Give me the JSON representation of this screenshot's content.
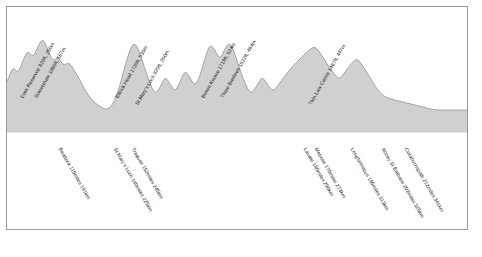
{
  "chart_data": {
    "type": "area",
    "title": "",
    "subtitle": "",
    "xlabel": "",
    "ylabel": "",
    "grid": false,
    "legend_position": "none",
    "axis": {
      "x_range_km": [
        191,
        341
      ],
      "y_range_m": [
        0,
        600
      ]
    },
    "summit_labels": [
      {
        "name": "Daer Reservoir",
        "elev_ft": "820ft",
        "elev_m": "250m",
        "text": "Daer Reservoir 820ft, 250m",
        "x": 24,
        "y": 94
      },
      {
        "name": "Sweetshaw",
        "elev_ft": "1860ft",
        "elev_m": "567m",
        "text": "Sweetshaw 1860ft, 567m",
        "x": 38,
        "y": 94
      },
      {
        "name": "Ettrick Head",
        "elev_ft": "1739ft",
        "elev_m": "530m",
        "text": "Ettrick Head 1739ft, 530m",
        "x": 119,
        "y": 94
      },
      {
        "name": "St Mary's Loch",
        "elev_ft": "820ft",
        "elev_m": "250m",
        "text": "St Mary's Loch 820ft, 250m",
        "x": 139,
        "y": 101
      },
      {
        "name": "Brown Knowe",
        "elev_ft": "1719ft",
        "elev_m": "524m",
        "text": "Brown Knowe 1719ft, 524m",
        "x": 205,
        "y": 94
      },
      {
        "name": "Three Brethren",
        "elev_ft": "1522ft",
        "elev_m": "464m",
        "text": "Three Brethren 1522ft, 464m",
        "x": 224,
        "y": 94
      },
      {
        "name": "Twin Law Cairns",
        "elev_ft": "1467ft",
        "elev_m": "447m",
        "text": "Twin Law Cairns 1467ft, 447m",
        "x": 312,
        "y": 101
      }
    ],
    "distance_labels": [
      {
        "name": "Beattock",
        "miles": "119miles",
        "km": "191km",
        "text": "Beattock 119miles 191km",
        "x": 62,
        "y": 147
      },
      {
        "name": "St Mary's Loch",
        "miles": "140miles",
        "km": "225km",
        "text": "St Mary's Loch 140miles 225km",
        "x": 117,
        "y": 147
      },
      {
        "name": "Traquair",
        "miles": "152miles",
        "km": "245km",
        "text": "Traquair 152miles 245km",
        "x": 135,
        "y": 147
      },
      {
        "name": "Lauder",
        "miles": "180miles",
        "km": "290km",
        "text": "Lauder 180miles 290km",
        "x": 307,
        "y": 147
      },
      {
        "name": "Melrose",
        "miles": "170miles",
        "km": "273km",
        "text": "Melrose 170miles 273km",
        "x": 318,
        "y": 147
      },
      {
        "name": "Longformacus",
        "miles": "195miles",
        "km": "313km",
        "text": "Longformacus 195miles 313km",
        "x": 354,
        "y": 147
      },
      {
        "name": "Abbey St Bathans",
        "miles": "202miles",
        "km": "325km",
        "text": "Abbey St Bathans 202miles 325km",
        "x": 385,
        "y": 147
      },
      {
        "name": "Cockburnspath",
        "miles": "212miles",
        "km": "341km",
        "text": "Cockburnspath 212miles 341km",
        "x": 408,
        "y": 147
      }
    ],
    "profile_points": [
      [
        0,
        46
      ],
      [
        6,
        30
      ],
      [
        11,
        38
      ],
      [
        16,
        24
      ],
      [
        21,
        14
      ],
      [
        26,
        22
      ],
      [
        31,
        10
      ],
      [
        36,
        2
      ],
      [
        41,
        14
      ],
      [
        46,
        26
      ],
      [
        51,
        20
      ],
      [
        56,
        30
      ],
      [
        62,
        26
      ],
      [
        67,
        34
      ],
      [
        73,
        44
      ],
      [
        79,
        56
      ],
      [
        85,
        64
      ],
      [
        92,
        70
      ],
      [
        99,
        74
      ],
      [
        105,
        70
      ],
      [
        111,
        56
      ],
      [
        117,
        34
      ],
      [
        122,
        16
      ],
      [
        127,
        6
      ],
      [
        132,
        14
      ],
      [
        137,
        30
      ],
      [
        143,
        48
      ],
      [
        148,
        58
      ],
      [
        153,
        52
      ],
      [
        158,
        40
      ],
      [
        163,
        48
      ],
      [
        168,
        56
      ],
      [
        173,
        46
      ],
      [
        178,
        34
      ],
      [
        183,
        42
      ],
      [
        188,
        50
      ],
      [
        193,
        40
      ],
      [
        198,
        22
      ],
      [
        203,
        8
      ],
      [
        208,
        14
      ],
      [
        213,
        24
      ],
      [
        218,
        12
      ],
      [
        223,
        6
      ],
      [
        228,
        18
      ],
      [
        233,
        34
      ],
      [
        239,
        50
      ],
      [
        244,
        58
      ],
      [
        250,
        50
      ],
      [
        255,
        40
      ],
      [
        260,
        48
      ],
      [
        266,
        56
      ],
      [
        272,
        48
      ],
      [
        278,
        40
      ],
      [
        284,
        32
      ],
      [
        290,
        26
      ],
      [
        296,
        20
      ],
      [
        302,
        14
      ],
      [
        308,
        10
      ],
      [
        314,
        18
      ],
      [
        320,
        28
      ],
      [
        326,
        36
      ],
      [
        332,
        44
      ],
      [
        338,
        36
      ],
      [
        344,
        28
      ],
      [
        350,
        22
      ],
      [
        356,
        30
      ],
      [
        362,
        40
      ],
      [
        368,
        50
      ],
      [
        374,
        58
      ],
      [
        380,
        62
      ],
      [
        388,
        64
      ],
      [
        396,
        66
      ],
      [
        404,
        68
      ],
      [
        412,
        70
      ],
      [
        420,
        72
      ],
      [
        428,
        74
      ],
      [
        436,
        74
      ],
      [
        444,
        74
      ],
      [
        452,
        74
      ],
      [
        460,
        74
      ]
    ],
    "colors": {
      "profile_fill": "#d0d0d0",
      "profile_line": "#8a8a8a",
      "band_fill": "#e6e6e6",
      "frame_stroke": "#9a9a9a",
      "label_text": "#1b1b1b"
    }
  }
}
